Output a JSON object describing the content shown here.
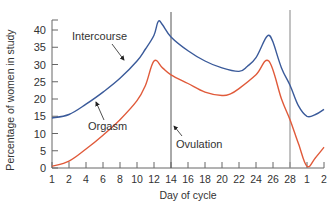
{
  "chart_data": {
    "type": "line",
    "title": "",
    "xlabel": "Day of cycle",
    "ylabel": "Percentage of women in study",
    "ylim": [
      0,
      45
    ],
    "yticks": [
      0,
      5,
      10,
      15,
      20,
      25,
      30,
      35,
      40
    ],
    "xtick_labels": [
      "1",
      "2",
      "4",
      "6",
      "8",
      "10",
      "12",
      "14",
      "16",
      "18",
      "20",
      "22",
      "24",
      "26",
      "28",
      "1",
      "2"
    ],
    "grid": false,
    "legend": "inline labels",
    "series": [
      {
        "name": "Intercourse",
        "color": "#3a5a9a",
        "points": [
          [
            1,
            14.5
          ],
          [
            2,
            15.5
          ],
          [
            4,
            18.5
          ],
          [
            6,
            22
          ],
          [
            8,
            26
          ],
          [
            10,
            31
          ],
          [
            11,
            34.5
          ],
          [
            12,
            38.5
          ],
          [
            12.5,
            42.5
          ],
          [
            13,
            41.5
          ],
          [
            14,
            38
          ],
          [
            16,
            34
          ],
          [
            18,
            31
          ],
          [
            20,
            29
          ],
          [
            22,
            28
          ],
          [
            23,
            29.5
          ],
          [
            24,
            32
          ],
          [
            25,
            37
          ],
          [
            25.5,
            38.5
          ],
          [
            26,
            36.5
          ],
          [
            27,
            29
          ],
          [
            28,
            24
          ],
          [
            29,
            18
          ],
          [
            30,
            15
          ],
          [
            31,
            15.5
          ],
          [
            32,
            17
          ]
        ]
      },
      {
        "name": "Orgasm",
        "color": "#e05a3a",
        "points": [
          [
            1,
            0.5
          ],
          [
            2,
            2
          ],
          [
            4,
            5.5
          ],
          [
            6,
            9.5
          ],
          [
            8,
            14
          ],
          [
            10,
            19.5
          ],
          [
            11,
            24
          ],
          [
            12,
            31
          ],
          [
            13,
            29
          ],
          [
            14,
            27
          ],
          [
            16,
            24.5
          ],
          [
            18,
            22
          ],
          [
            20,
            21
          ],
          [
            21,
            21.5
          ],
          [
            22,
            23
          ],
          [
            24,
            27
          ],
          [
            25.5,
            31
          ],
          [
            27,
            20
          ],
          [
            28,
            14
          ],
          [
            29,
            7
          ],
          [
            30,
            0.5
          ],
          [
            31,
            3
          ],
          [
            32,
            6
          ]
        ]
      }
    ],
    "vertical_lines": [
      {
        "x": 14,
        "label": "Ovulation"
      },
      {
        "x": 28,
        "label": ""
      }
    ],
    "annotations": [
      {
        "text": "Intercourse",
        "arrow_to": "Intercourse curve near day 10"
      },
      {
        "text": "Orgasm",
        "arrow_to": "Orgasm curve near day 11"
      },
      {
        "text": "Ovulation",
        "arrow_to": "vertical line at day 14"
      }
    ]
  },
  "labels": {
    "xlabel": "Day of cycle",
    "ylabel": "Percentage of women in study",
    "intercourse": "Intercourse",
    "orgasm": "Orgasm",
    "ovulation": "Ovulation"
  }
}
